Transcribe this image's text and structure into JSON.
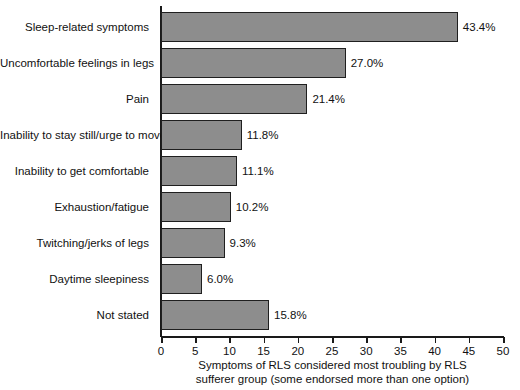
{
  "chart_data": {
    "type": "bar",
    "orientation": "horizontal",
    "title": "",
    "xlabel": "Symptoms of RLS considered most troubling by RLS sufferer group (some endorsed more than one option)",
    "ylabel": "",
    "xlim": [
      0,
      50
    ],
    "xticks": [
      0,
      5,
      10,
      15,
      20,
      25,
      30,
      35,
      40,
      45,
      50
    ],
    "grid": false,
    "legend": null,
    "bar_color": "#8d8d8d",
    "bar_edge_color": "#1f1f1f",
    "categories": [
      "Sleep-related symptoms",
      "Uncomfortable feelings in legs",
      "Pain",
      "Inability to stay still/urge to move",
      "Inability to get comfortable",
      "Exhaustion/fatigue",
      "Twitching/jerks of legs",
      "Daytime sleepiness",
      "Not stated"
    ],
    "values": [
      43.4,
      27.0,
      21.4,
      11.8,
      11.1,
      10.2,
      9.3,
      6.0,
      15.8
    ],
    "value_labels": [
      "43.4%",
      "27.0%",
      "21.4%",
      "11.8%",
      "11.1%",
      "10.2%",
      "9.3%",
      "6.0%",
      "15.8%"
    ]
  },
  "caption": {
    "line1": "Symptoms of RLS considered most troubling by RLS",
    "line2": "sufferer group (some endorsed more than one option)"
  }
}
